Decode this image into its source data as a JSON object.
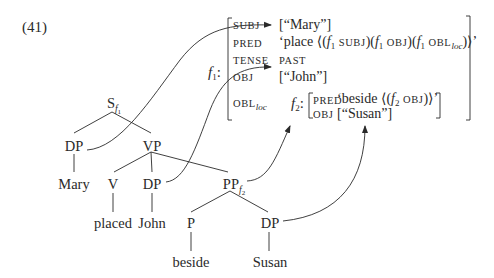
{
  "example_number": "(41)",
  "c_structure": {
    "root": {
      "label": "S",
      "subscript": "f",
      "subsubscript": "1"
    },
    "nodes": {
      "dp_subj": "DP",
      "vp": "VP",
      "mary": "Mary",
      "v": "V",
      "dp_obj": "DP",
      "pp": {
        "label": "PP",
        "subscript": "f",
        "subsubscript": "2"
      },
      "placed": "placed",
      "john": "John",
      "p": "P",
      "dp_pobj": "DP",
      "beside": "beside",
      "susan": "Susan"
    }
  },
  "f_structure": {
    "outer": {
      "name": "f",
      "name_sub": "1",
      "colon": ":",
      "rows": [
        {
          "attr": "SUBJ",
          "value": "[“Mary”]"
        },
        {
          "attr": "PRED",
          "value_parts": {
            "open": "‘place ⟨(",
            "f": "f",
            "f_sub": "1",
            "subj": "SUBJ",
            "mid1": ")(",
            "obj": "OBJ",
            "mid2": ")(",
            "obl": "OBL",
            "obl_sub": "loc",
            "close": ")⟩’"
          }
        },
        {
          "attr": "TENSE",
          "value": "PAST"
        },
        {
          "attr": "OBJ",
          "value": "[“John”]"
        },
        {
          "attr": "OBL",
          "attr_sub": "loc"
        }
      ]
    },
    "inner": {
      "name": "f",
      "name_sub": "2",
      "colon": ":",
      "rows": [
        {
          "attr": "PRED",
          "value_parts": {
            "open": "‘beside ⟨(",
            "f": "f",
            "f_sub": "2",
            "obj": "OBJ",
            "close": ")⟩’"
          }
        },
        {
          "attr": "OBJ",
          "value": "[“Susan”]"
        }
      ]
    }
  },
  "mappings": [
    {
      "from": "DP (subject)",
      "to": "SUBJ"
    },
    {
      "from": "DP (object)",
      "to": "OBJ"
    },
    {
      "from": "PP f2",
      "to": "f2 structure"
    },
    {
      "from": "DP (Susan)",
      "to": "[“Susan”]"
    }
  ],
  "colors": {
    "ink": "#2a2a2a",
    "background": "#ffffff"
  }
}
